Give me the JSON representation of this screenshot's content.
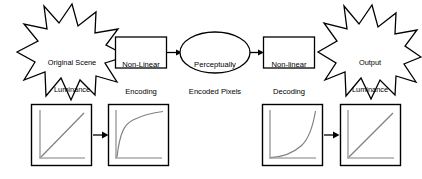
{
  "diagram": {
    "title_text": "",
    "colors": {
      "stroke": "#000000",
      "fill": "#ffffff",
      "plot_line": "#808080",
      "plot_axis": "#808080",
      "background": "#ffffff"
    },
    "nodes": [
      {
        "id": "original-scene-luminance",
        "shape": "starburst",
        "name": "original-scene-luminance-burst",
        "label": "Original Scene\nLuminance",
        "line1": "Original Scene",
        "line2": "Luminance"
      },
      {
        "id": "non-linear-encoding",
        "shape": "rectangle",
        "name": "non-linear-encoding-box",
        "label": "Non-Linear\nEncoding",
        "line1": "Non-Linear",
        "line2": "Encoding"
      },
      {
        "id": "perceptually-encoded-pixels",
        "shape": "ellipse",
        "name": "perceptually-encoded-pixels-ellipse",
        "label": "Perceptually\nEncoded Pixels",
        "line1": "Perceptually",
        "line2": "Encoded Pixels"
      },
      {
        "id": "non-linear-decoding",
        "shape": "rectangle",
        "name": "non-linear-decoding-box",
        "label": "Non-linear\nDecoding",
        "line1": "Non-linear",
        "line2": "Decoding"
      },
      {
        "id": "output-luminance",
        "shape": "starburst",
        "name": "output-luminance-burst",
        "label": "Output\nLuminance",
        "line1": "Output",
        "line2": "Luminance"
      }
    ],
    "plots": [
      {
        "id": "plot-linear-input",
        "name": "plot-linear-input",
        "curve": "linear",
        "description": "linear ramp"
      },
      {
        "id": "plot-encoded-nonlinear",
        "name": "plot-encoded-nonlinear",
        "curve": "logarithmic",
        "description": "concave compressive curve"
      },
      {
        "id": "plot-decoded-nonlinear",
        "name": "plot-decoded-nonlinear",
        "curve": "exponential",
        "description": "convex expansive curve"
      },
      {
        "id": "plot-linear-output",
        "name": "plot-linear-output",
        "curve": "linear",
        "description": "linear ramp"
      }
    ],
    "connectors": [
      {
        "id": "arrow-encode-to-pixels",
        "name": "arrow-encoding-to-pixels"
      },
      {
        "id": "arrow-pixels-to-decode",
        "name": "arrow-pixels-to-decoding"
      },
      {
        "id": "arrow-plot1-to-plot2",
        "name": "arrow-plot-linear-to-encoded"
      },
      {
        "id": "arrow-plot3-to-plot4",
        "name": "arrow-plot-decoded-to-linear"
      }
    ]
  }
}
